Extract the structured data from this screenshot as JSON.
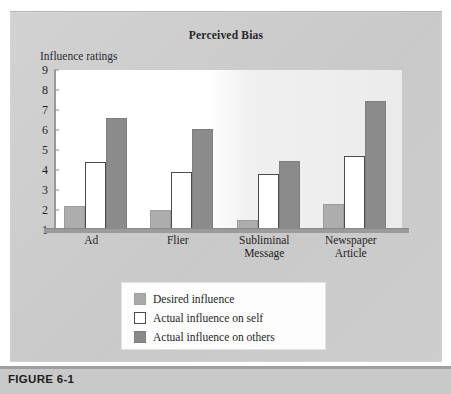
{
  "figure": {
    "caption": "FIGURE 6-1"
  },
  "chart_data": {
    "type": "bar",
    "title": "Perceived Bias",
    "xlabel": "",
    "ylabel": "Influence ratings",
    "ylim": [
      1,
      9
    ],
    "yticks": [
      1,
      2,
      3,
      4,
      5,
      6,
      7,
      8,
      9
    ],
    "ytick_labels": [
      "1",
      "2",
      "3",
      "4",
      "5",
      "6",
      "7",
      "8",
      "9"
    ],
    "grid": false,
    "legend_position": "bottom-center",
    "categories": [
      "Ad",
      "Flier",
      "Subliminal Message",
      "Newspaper Article"
    ],
    "category_lines": [
      [
        "Ad"
      ],
      [
        "Flier"
      ],
      [
        "Subliminal",
        "Message"
      ],
      [
        "Newspaper",
        "Article"
      ]
    ],
    "series": [
      {
        "name": "Desired influence",
        "color": "#adadad",
        "values": [
          2.2,
          2.0,
          1.5,
          2.3
        ]
      },
      {
        "name": "Actual influence on self",
        "color": "#ffffff",
        "values": [
          4.4,
          3.9,
          3.8,
          4.7
        ]
      },
      {
        "name": "Actual influence on others",
        "color": "#8b8b8b",
        "values": [
          6.6,
          6.05,
          4.45,
          7.45
        ]
      }
    ]
  },
  "legend": {
    "items": [
      {
        "label": "Desired influence",
        "swatch": "desired"
      },
      {
        "label": "Actual influence on self",
        "swatch": "self"
      },
      {
        "label": "Actual influence on others",
        "swatch": "others"
      }
    ]
  }
}
